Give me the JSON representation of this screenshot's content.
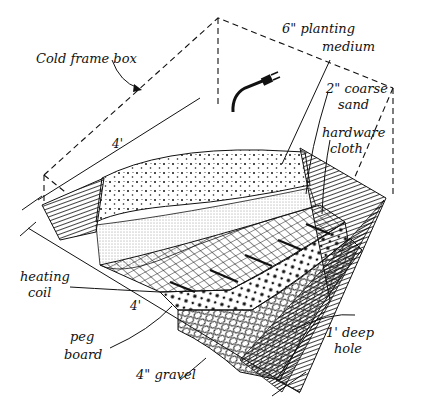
{
  "diagram": {
    "type": "illustration",
    "colors": {
      "ink": "#111111",
      "background": "#ffffff"
    },
    "labels": {
      "cold_frame_box": "Cold frame box",
      "planting_medium_line1": "6\" planting",
      "planting_medium_line2": "medium",
      "coarse_sand_line1": "2\" coarse",
      "coarse_sand_line2": "sand",
      "hardware_cloth_line1": "hardware",
      "hardware_cloth_line2": "cloth",
      "heating_coil_line1": "heating",
      "heating_coil_line2": "coil",
      "peg_board_line1": "peg",
      "peg_board_line2": "board",
      "gravel": "4\" gravel",
      "deep_hole_line1": "1' deep",
      "deep_hole_line2": "hole"
    },
    "dimensions": {
      "top_width": "4'",
      "front_width": "4'"
    },
    "layers": [
      "6\" planting medium",
      "2\" coarse sand",
      "hardware cloth",
      "heating coil",
      "peg board",
      "4\" gravel",
      "1' deep hole"
    ]
  }
}
